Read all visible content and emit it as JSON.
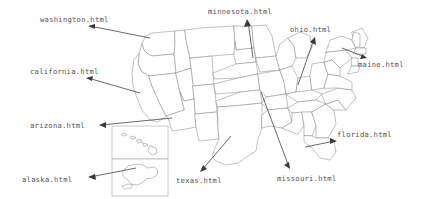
{
  "page": {
    "background_color": "#ffffff",
    "map_outline_color": "#777777",
    "annotation_color": "#3a3a3a",
    "label_color": "#55524f"
  },
  "map": {
    "name": "usa-map",
    "inset_names": [
      "hawaii-inset",
      "alaska-inset"
    ]
  },
  "annotations": [
    {
      "id": "washington",
      "label": "washington.html",
      "label_x": 40,
      "label_y": 16,
      "head_x": 88,
      "head_y": 26,
      "tail_x": 150,
      "tail_y": 38
    },
    {
      "id": "california",
      "label": "california.html",
      "label_x": 30,
      "label_y": 68,
      "head_x": 86,
      "head_y": 78,
      "tail_x": 140,
      "tail_y": 93
    },
    {
      "id": "arizona",
      "label": "arizona.html",
      "label_x": 30,
      "label_y": 122,
      "head_x": 99,
      "head_y": 125,
      "tail_x": 172,
      "tail_y": 118
    },
    {
      "id": "alaska",
      "label": "alaska.html",
      "label_x": 22,
      "label_y": 176,
      "head_x": 88,
      "head_y": 177,
      "tail_x": 136,
      "tail_y": 168
    },
    {
      "id": "minnesota",
      "label": "minnesota.html",
      "label_x": 208,
      "label_y": 8,
      "head_x": 247,
      "head_y": 19,
      "tail_x": 253,
      "tail_y": 58
    },
    {
      "id": "ohio",
      "label": "ohio.html",
      "label_x": 290,
      "label_y": 26,
      "head_x": 315,
      "head_y": 37,
      "tail_x": 298,
      "tail_y": 85
    },
    {
      "id": "maine",
      "label": "maine.html",
      "label_x": 358,
      "label_y": 61,
      "head_x": 367,
      "head_y": 58,
      "tail_x": 342,
      "tail_y": 48
    },
    {
      "id": "florida",
      "label": "florida.html",
      "label_x": 337,
      "label_y": 131,
      "head_x": 337,
      "head_y": 141,
      "tail_x": 305,
      "tail_y": 147
    },
    {
      "id": "texas",
      "label": "texas.html",
      "label_x": 176,
      "label_y": 177,
      "head_x": 200,
      "head_y": 172,
      "tail_x": 231,
      "tail_y": 136
    },
    {
      "id": "missouri",
      "label": "missouri.html",
      "label_x": 277,
      "label_y": 175,
      "head_x": 290,
      "head_y": 169,
      "tail_x": 261,
      "tail_y": 92
    }
  ]
}
